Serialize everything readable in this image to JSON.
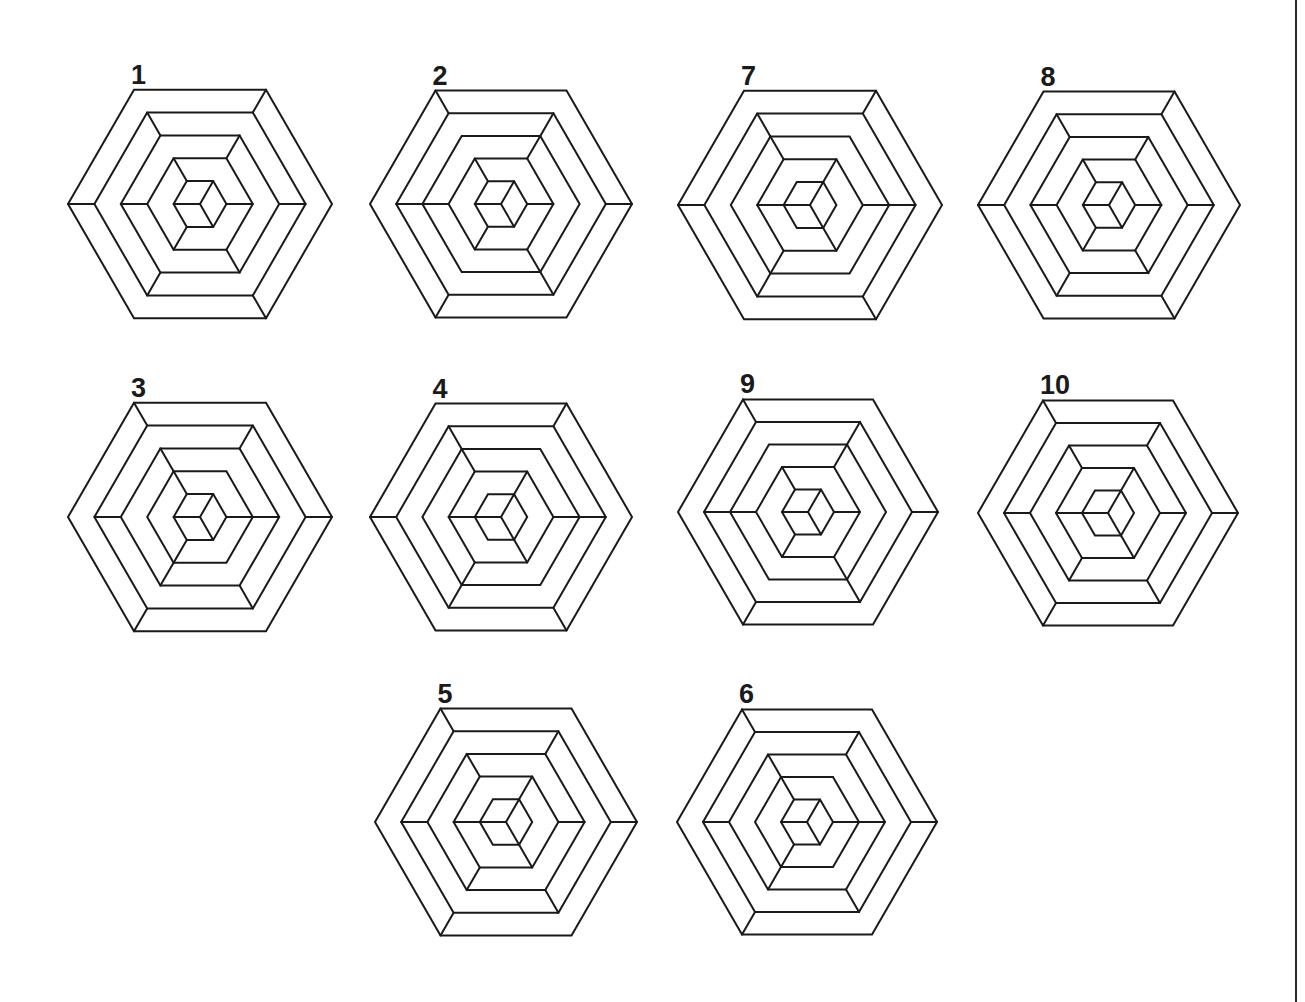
{
  "figure": {
    "stroke_color": "#1a1a1a",
    "background": "#ffffff",
    "ring_fractions": [
      1.0,
      0.8,
      0.6,
      0.4,
      0.2
    ],
    "vertex_index_legend": [
      "right",
      "bottom-right",
      "bottom-left",
      "left",
      "top-left",
      "top-right"
    ],
    "hexagons": [
      {
        "label": "1",
        "cx": 200,
        "cy": 204,
        "r": 132,
        "connectors": [
          [
            1,
            3,
            5
          ],
          [
            0,
            2,
            4
          ],
          [
            1,
            3,
            5
          ],
          [
            0,
            2,
            4
          ]
        ],
        "center_spokes": [
          1,
          3,
          5
        ]
      },
      {
        "label": "2",
        "cx": 501,
        "cy": 204,
        "r": 131,
        "connectors": [
          [
            0,
            2,
            4
          ],
          [
            1,
            3,
            5
          ],
          [
            1,
            3,
            5
          ],
          [
            0,
            2,
            4
          ]
        ],
        "center_spokes": [
          1,
          3,
          5
        ]
      },
      {
        "label": "7",
        "cx": 810,
        "cy": 205,
        "r": 132,
        "connectors": [
          [
            1,
            3,
            5
          ],
          [
            0,
            2,
            4
          ],
          [
            0,
            2,
            4
          ],
          [
            1,
            3,
            5
          ]
        ],
        "center_spokes": [
          1,
          3,
          5
        ]
      },
      {
        "label": "8",
        "cx": 1109,
        "cy": 205,
        "r": 131,
        "connectors": [
          [
            1,
            3,
            5
          ],
          [
            0,
            2,
            4
          ],
          [
            1,
            3,
            5
          ],
          [
            0,
            2,
            4
          ]
        ],
        "center_spokes": [
          1,
          3,
          5
        ]
      },
      {
        "label": "3",
        "cx": 200,
        "cy": 517,
        "r": 132,
        "connectors": [
          [
            0,
            2,
            4
          ],
          [
            1,
            3,
            5
          ],
          [
            0,
            2,
            4
          ],
          [
            0,
            2,
            4
          ]
        ],
        "center_spokes": [
          1,
          3,
          5
        ]
      },
      {
        "label": "4",
        "cx": 501,
        "cy": 517,
        "r": 131,
        "connectors": [
          [
            1,
            3,
            5
          ],
          [
            0,
            2,
            4
          ],
          [
            0,
            2,
            4
          ],
          [
            1,
            3,
            5
          ]
        ],
        "center_spokes": [
          1,
          3,
          5
        ]
      },
      {
        "label": "9",
        "cx": 808,
        "cy": 512,
        "r": 130,
        "connectors": [
          [
            0,
            2,
            4
          ],
          [
            1,
            3,
            5
          ],
          [
            1,
            3,
            5
          ],
          [
            0,
            2,
            4
          ]
        ],
        "center_spokes": [
          1,
          3,
          5
        ]
      },
      {
        "label": "10",
        "cx": 1108,
        "cy": 513,
        "r": 130,
        "connectors": [
          [
            0,
            2,
            4
          ],
          [
            1,
            3,
            5
          ],
          [
            0,
            2,
            4
          ],
          [
            1,
            3,
            5
          ]
        ],
        "center_spokes": [
          1,
          3,
          5
        ]
      },
      {
        "label": "5",
        "cx": 506,
        "cy": 822,
        "r": 131,
        "connectors": [
          [
            0,
            2,
            4
          ],
          [
            1,
            3,
            5
          ],
          [
            0,
            2,
            4
          ],
          [
            1,
            3,
            5
          ]
        ],
        "center_spokes": [
          1,
          3,
          5
        ]
      },
      {
        "label": "6",
        "cx": 807,
        "cy": 822,
        "r": 130,
        "connectors": [
          [
            0,
            2,
            4
          ],
          [
            1,
            3,
            5
          ],
          [
            0,
            2,
            4
          ],
          [
            0,
            2,
            4
          ]
        ],
        "center_spokes": [
          1,
          3,
          5
        ]
      }
    ]
  }
}
